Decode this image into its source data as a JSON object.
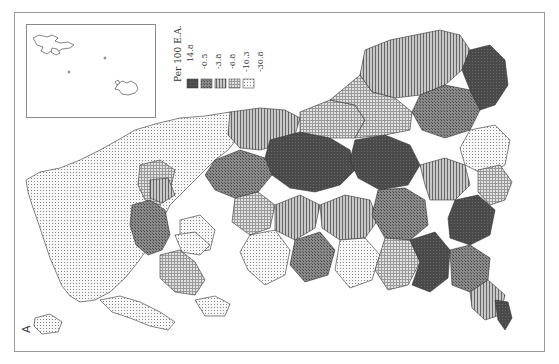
{
  "figure": {
    "panel_label": "A",
    "orientation": "rotated 90 degrees counter-clockwise",
    "inset": {
      "description": "Island groups inset"
    }
  },
  "legend": {
    "title": "Per 100 E.A.",
    "breaks": [
      "14.8",
      "-0.5",
      "-3.8",
      "-6.8",
      "-10.3",
      "-30.8"
    ],
    "classes": [
      {
        "range": "14.8 to -0.5",
        "pattern": "dark-solid",
        "color": "#555555"
      },
      {
        "range": "-0.5 to -3.8",
        "pattern": "cross-hatch",
        "color": "#7a7a7a"
      },
      {
        "range": "-3.8 to -6.8",
        "pattern": "vertical-lines",
        "color": "#9a9a9a"
      },
      {
        "range": "-6.8 to -10.3",
        "pattern": "grid",
        "color": "#bdbdbd"
      },
      {
        "range": "-10.3 to -30.8",
        "pattern": "dots",
        "color": "#dcdcdc"
      }
    ]
  }
}
